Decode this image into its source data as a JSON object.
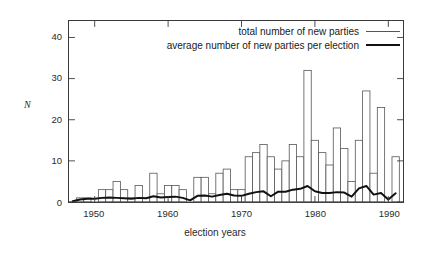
{
  "chart_data": {
    "type": "bar",
    "title": "",
    "xlabel": "election years",
    "ylabel": "N",
    "xlim": [
      1946.5,
      1992.0
    ],
    "ylim": [
      0,
      44
    ],
    "grid": false,
    "legend_position": "top-right",
    "y_ticks": [
      0,
      10,
      20,
      30,
      40
    ],
    "y_tick_labels": [
      "0",
      "10",
      "20",
      "30",
      "40"
    ],
    "x_ticks": [
      1950,
      1960,
      1970,
      1980,
      1990
    ],
    "x_tick_labels": [
      "1950",
      "1960",
      "1970",
      "1980",
      "1990"
    ],
    "x": [
      1947,
      1948,
      1949,
      1950,
      1951,
      1952,
      1953,
      1954,
      1955,
      1956,
      1957,
      1958,
      1959,
      1960,
      1961,
      1962,
      1963,
      1964,
      1965,
      1966,
      1967,
      1968,
      1969,
      1970,
      1971,
      1972,
      1973,
      1974,
      1975,
      1976,
      1977,
      1978,
      1979,
      1980,
      1981,
      1982,
      1983,
      1984,
      1985,
      1986,
      1987,
      1988,
      1989,
      1990,
      1991
    ],
    "series": [
      {
        "name": "total number of new parties",
        "type": "bar",
        "style": "outline",
        "color": "#555555",
        "values": [
          0,
          1,
          1,
          0,
          3,
          3,
          5,
          3,
          1,
          4,
          1,
          7,
          2,
          4,
          4,
          3,
          0,
          6,
          6,
          2,
          7,
          8,
          3,
          3,
          11,
          12,
          14,
          11,
          8,
          10,
          14,
          11,
          32,
          15,
          12,
          9,
          18,
          13,
          5,
          15,
          27,
          7,
          23,
          0,
          11
        ]
      },
      {
        "name": "average number of new parties per election",
        "type": "line",
        "style": "thick",
        "color": "#111111",
        "values": [
          0.2,
          0.6,
          0.8,
          0.8,
          1.0,
          1.1,
          1.0,
          0.9,
          0.8,
          1.0,
          0.9,
          1.4,
          1.1,
          1.2,
          1.3,
          1.0,
          0.4,
          1.5,
          1.6,
          1.3,
          1.7,
          2.0,
          1.6,
          1.5,
          2.0,
          2.4,
          2.6,
          1.4,
          2.5,
          2.5,
          3.0,
          3.2,
          3.9,
          2.6,
          2.2,
          2.2,
          2.4,
          2.3,
          1.3,
          3.3,
          3.9,
          1.8,
          2.2,
          0.6,
          2.1
        ]
      }
    ]
  },
  "legend": {
    "items": [
      {
        "label": "total number of new parties",
        "swatch": "thin-line"
      },
      {
        "label": "average number of new parties per election",
        "swatch": "thick-line"
      }
    ]
  },
  "axes": {
    "y_title": "N",
    "x_title": "election years"
  }
}
